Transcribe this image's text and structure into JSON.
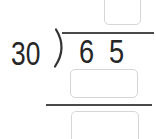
{
  "problem": {
    "type": "long-division",
    "divisor": "30",
    "dividend": "65",
    "dividend_digits": [
      "6",
      "5"
    ]
  },
  "answer_boxes": {
    "quotient": {
      "value": "",
      "placeholder": ""
    },
    "product": {
      "value": "",
      "placeholder": ""
    },
    "remainder": {
      "value": "",
      "placeholder": ""
    }
  },
  "colors": {
    "background": "#ffffff",
    "digit_text": "#262626",
    "division_lines": "#4a4a4a",
    "box_border": "#d6d6d6"
  }
}
